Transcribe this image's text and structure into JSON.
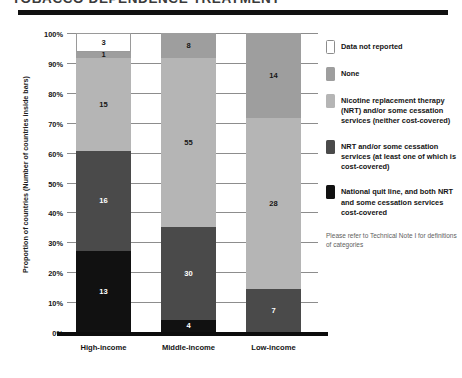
{
  "header": {
    "title": "TOBACCO DEPENDENCE TREATMENT",
    "rule": "title-rule"
  },
  "axes": {
    "ylabel": "Proportion of countries (Number of countries inside bars)",
    "yticks": [
      "100%",
      "90%",
      "80%",
      "70%",
      "60%",
      "50%",
      "40%",
      "30%",
      "20%",
      "10%",
      "0%"
    ],
    "categories": [
      "High-income",
      "Middle-income",
      "Low-income"
    ]
  },
  "legend": {
    "items": [
      {
        "label": "Data not reported",
        "color": "#ffffff",
        "swatch_name": "swatch-data-not-reported"
      },
      {
        "label": "None",
        "color": "#9e9e9e",
        "swatch_name": "swatch-none"
      },
      {
        "label": "Nicotine replacement therapy (NRT) and/or some cessation services (neither cost-covered)",
        "color": "#b5b5b5",
        "swatch_name": "swatch-nrt-not-covered"
      },
      {
        "label": "NRT and/or some cessation services (at least one of which is cost-covered)",
        "color": "#4a4a4a",
        "swatch_name": "swatch-nrt-partly-covered"
      },
      {
        "label": "National quit line, and both NRT and some cessation services cost-covered",
        "color": "#111111",
        "swatch_name": "swatch-quitline-fully-covered"
      }
    ],
    "note": "Please refer to Technical Note I for definitions of categories"
  },
  "chart_data": {
    "type": "bar",
    "subtype": "stacked-100-percent",
    "title": "TOBACCO DEPENDENCE TREATMENT",
    "xlabel": "",
    "ylabel": "Proportion of countries (Number of countries inside bars)",
    "ylim": [
      0,
      100
    ],
    "ytick_values": [
      0,
      10,
      20,
      30,
      40,
      50,
      60,
      70,
      80,
      90,
      100
    ],
    "ytick_labels": [
      "0%",
      "10%",
      "20%",
      "30%",
      "40%",
      "50%",
      "60%",
      "70%",
      "80%",
      "90%",
      "100%"
    ],
    "grid": true,
    "legend_position": "right",
    "categories": [
      "High-income",
      "Middle-income",
      "Low-income"
    ],
    "totals": [
      48,
      97,
      49
    ],
    "value_unit": "number of countries",
    "series": [
      {
        "name": "National quit line, and both NRT and some cessation services cost-covered",
        "color": "#111111",
        "values": [
          13,
          4,
          0
        ],
        "percents": [
          27.1,
          4.1,
          0.0
        ]
      },
      {
        "name": "NRT and/or some cessation services (at least one of which is cost-covered)",
        "color": "#4a4a4a",
        "values": [
          16,
          30,
          7
        ],
        "percents": [
          33.3,
          30.9,
          14.3
        ]
      },
      {
        "name": "Nicotine replacement therapy (NRT) and/or some cessation services (neither cost-covered)",
        "color": "#b5b5b5",
        "values": [
          15,
          55,
          28
        ],
        "percents": [
          31.3,
          56.7,
          57.1
        ]
      },
      {
        "name": "None",
        "color": "#9e9e9e",
        "values": [
          1,
          8,
          14
        ],
        "percents": [
          2.1,
          8.2,
          28.6
        ]
      },
      {
        "name": "Data not reported",
        "color": "#ffffff",
        "values": [
          3,
          0,
          0
        ],
        "percents": [
          6.3,
          0.0,
          0.0
        ]
      }
    ],
    "annotations": [
      "Please refer to Technical Note I for definitions of categories"
    ]
  }
}
